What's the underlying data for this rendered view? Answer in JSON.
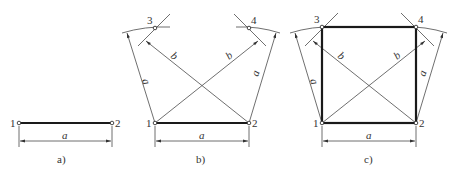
{
  "figure": {
    "panels": [
      {
        "id": "a",
        "caption": "a)",
        "points": [
          {
            "label": "1"
          },
          {
            "label": "2"
          }
        ],
        "dimension_label": "a"
      },
      {
        "id": "b",
        "caption": "b)",
        "points": [
          {
            "label": "1"
          },
          {
            "label": "2"
          },
          {
            "label": "3"
          },
          {
            "label": "4"
          }
        ],
        "dimension_label": "a",
        "radius_labels": {
          "side_left": "a",
          "side_right": "a",
          "diag_left": "b",
          "diag_right": "b"
        }
      },
      {
        "id": "c",
        "caption": "c)",
        "points": [
          {
            "label": "1"
          },
          {
            "label": "2"
          },
          {
            "label": "3"
          },
          {
            "label": "4"
          }
        ],
        "dimension_label": "a",
        "radius_labels": {
          "side_left": "a",
          "side_right": "a",
          "diag_left": "b",
          "diag_right": "b"
        }
      }
    ],
    "colors": {
      "line": "#4a4a4a",
      "thick_line": "#1a1a1a",
      "text": "#333333",
      "background": "#ffffff"
    }
  }
}
